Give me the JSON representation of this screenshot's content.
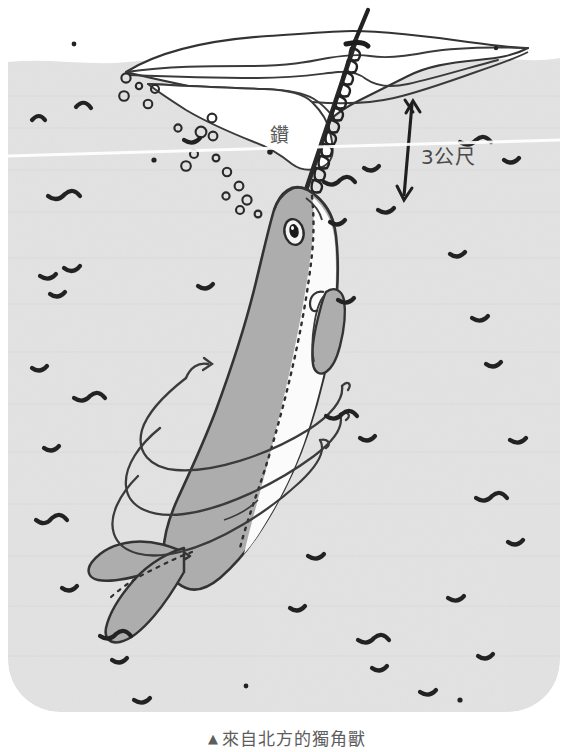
{
  "figure": {
    "caption_marker": "▲",
    "caption_text": "來自北方的獨角獸",
    "labels": {
      "depth": "3公尺",
      "ice_drill": "鑽"
    },
    "colors": {
      "water": "#e2e2e2",
      "ice_white": "#fdfdfd",
      "body_gray": "#adadad",
      "belly_white": "#fbfbfb",
      "ink": "#2b2b2b",
      "caption_text": "#5d5d5d",
      "page_background": "#ffffff"
    },
    "scene": {
      "subject": "narwhal",
      "tusk_description": "spiral tusk piercing ice floe",
      "ice_floe": "floating sea ice at surface",
      "water_surface_y": 62,
      "scan_artifact": "white diagonal scan line",
      "bubbles_count": 18,
      "ripple_marks_count": 34,
      "motion_arrow": "helical spiral around body",
      "fins": [
        "left flipper",
        "tail fluke"
      ]
    },
    "measurement": {
      "arrow_type": "double-headed vertical arrow",
      "value": "3公尺"
    }
  }
}
